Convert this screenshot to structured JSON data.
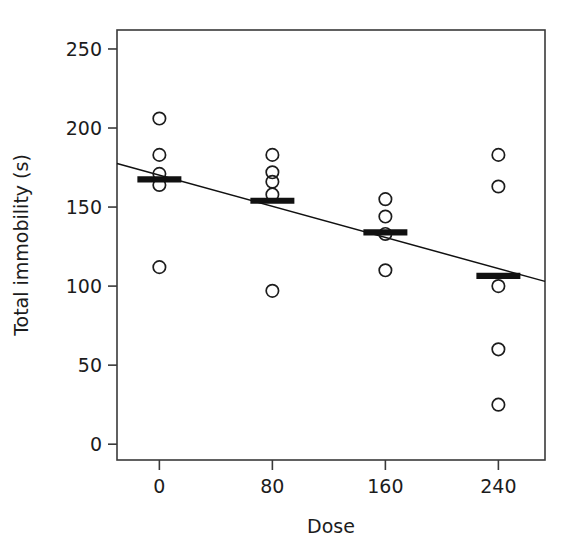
{
  "chart_data": {
    "type": "scatter",
    "title": "",
    "xlabel": "Dose",
    "ylabel": "Total immobility (s)",
    "xlim": [
      -30,
      273
    ],
    "ylim": [
      -10,
      262
    ],
    "xticks": [
      0,
      80,
      160,
      240
    ],
    "xtick_labels": [
      "0",
      "80",
      "160",
      "240"
    ],
    "yticks": [
      0,
      50,
      100,
      150,
      200,
      250
    ],
    "ytick_labels": [
      "0",
      "50",
      "100",
      "150",
      "200",
      "250"
    ],
    "grid": false,
    "legend": false,
    "legend_position": "none",
    "point_marker": "open-circle",
    "point_color": "#1c1c1c",
    "line_color": "#111111",
    "groups": [
      {
        "dose": 0,
        "values": [
          206,
          183,
          171,
          164,
          112
        ],
        "mean": 167.5
      },
      {
        "dose": 80,
        "values": [
          183,
          172,
          166,
          158,
          97
        ],
        "mean": 154.0
      },
      {
        "dose": 160,
        "values": [
          155,
          144,
          133,
          110
        ],
        "mean": 134.0
      },
      {
        "dose": 240,
        "values": [
          183,
          163,
          100,
          60,
          25
        ],
        "mean": 106.5
      }
    ],
    "mean_markers": {
      "label": "group-mean-bar",
      "values": [
        167.5,
        154.0,
        134.0,
        106.5
      ]
    },
    "regression": {
      "label": "linear-fit",
      "x_start": -30,
      "y_start": 177.5,
      "x_end": 273,
      "y_end": 103.0,
      "slope": -0.246,
      "intercept": 170.1
    }
  }
}
